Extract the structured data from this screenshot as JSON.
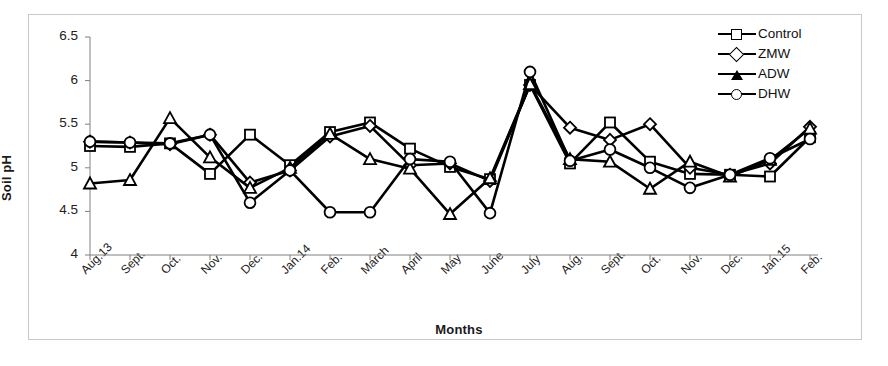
{
  "chart_data": {
    "type": "line",
    "title": "",
    "xlabel": "Months",
    "ylabel": "Soil pH",
    "ylim": [
      4,
      6.5
    ],
    "ytick_labels": [
      "4",
      "4.5",
      "5",
      "5.5",
      "6",
      "6.5"
    ],
    "ytick_values": [
      4,
      4.5,
      5,
      5.5,
      6,
      6.5
    ],
    "grid": false,
    "legend_position": "top-right",
    "categories": [
      "Aug.13",
      "Sept.",
      "Oct.",
      "Nov.",
      "Dec.",
      "Jan.14",
      "Feb.",
      "March",
      "April",
      "May",
      "June",
      "July",
      "Aug.",
      "Sept.",
      "Oct.",
      "Nov.",
      "Dec.",
      "Jan.15",
      "Feb."
    ],
    "series": [
      {
        "name": "Control",
        "marker": "square",
        "values": [
          5.25,
          5.24,
          5.28,
          4.93,
          5.38,
          5.03,
          5.41,
          5.52,
          5.22,
          5.01,
          4.87,
          5.95,
          5.05,
          5.52,
          5.07,
          4.93,
          4.92,
          4.9,
          5.35
        ]
      },
      {
        "name": "ZMW",
        "marker": "diamond",
        "values": [
          5.3,
          5.29,
          5.27,
          5.38,
          4.83,
          4.97,
          5.36,
          5.48,
          5.03,
          5.05,
          4.85,
          5.95,
          5.46,
          5.32,
          5.5,
          5.0,
          4.92,
          5.05,
          5.47
        ]
      },
      {
        "name": "ADW",
        "marker": "triangle",
        "values": [
          4.82,
          4.86,
          5.57,
          5.12,
          4.77,
          5.0,
          5.39,
          5.1,
          4.99,
          4.47,
          4.88,
          5.96,
          5.1,
          5.07,
          4.76,
          5.07,
          4.9,
          5.09,
          5.45
        ]
      },
      {
        "name": "DHW",
        "marker": "circle",
        "values": [
          5.3,
          5.29,
          5.28,
          5.38,
          4.6,
          4.97,
          4.49,
          4.49,
          5.1,
          5.07,
          4.48,
          6.1,
          5.08,
          5.21,
          5.0,
          4.77,
          4.92,
          5.11,
          5.33
        ]
      }
    ]
  },
  "legend": {
    "items": [
      {
        "label": "Control"
      },
      {
        "label": "ZMW"
      },
      {
        "label": "ADW"
      },
      {
        "label": "DHW"
      }
    ]
  },
  "colors": {
    "series_line": "#000000",
    "frame": "#c9c9c9",
    "axis": "#808080",
    "text": "#1a1a1a"
  }
}
